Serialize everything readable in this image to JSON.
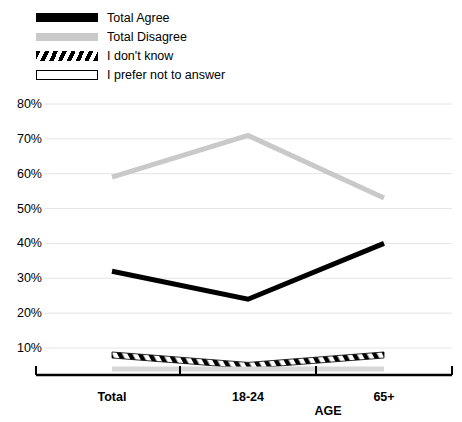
{
  "legend": {
    "items": [
      {
        "label": "Total Agree",
        "style": "solid-black",
        "color": "#000000"
      },
      {
        "label": "Total Disagree",
        "style": "solid-gray",
        "color": "#c9c9c9"
      },
      {
        "label": "I don't know",
        "style": "hatch",
        "color": "#000000"
      },
      {
        "label": "I prefer not to answer",
        "style": "outline",
        "color": "#ffffff"
      }
    ]
  },
  "axes": {
    "y_ticks": [
      "80%",
      "70%",
      "60%",
      "50%",
      "40%",
      "30%",
      "20%",
      "10%"
    ],
    "x_labels": [
      "Total",
      "18-24",
      "65+"
    ],
    "x_title": "AGE"
  },
  "chart_data": {
    "type": "line",
    "title": "",
    "subtitle": "",
    "xlabel": "AGE",
    "ylabel": "",
    "categories": [
      "Total",
      "18-24",
      "65+"
    ],
    "ylim": [
      0,
      80
    ],
    "ytick_values": [
      10,
      20,
      30,
      40,
      50,
      60,
      70,
      80
    ],
    "grid": true,
    "legend_position": "top-left",
    "series": [
      {
        "name": "Total Agree",
        "values": [
          32,
          24,
          40
        ],
        "color": "#000000",
        "style": "solid",
        "width": 5
      },
      {
        "name": "Total Disagree",
        "values": [
          59,
          71,
          53
        ],
        "color": "#c9c9c9",
        "style": "solid",
        "width": 5
      },
      {
        "name": "I don't know",
        "values": [
          8,
          5,
          8
        ],
        "color": "#000000",
        "style": "hatched",
        "width": 6
      },
      {
        "name": "I prefer not to answer",
        "values": [
          4,
          4,
          4
        ],
        "color": "#d7d7d7",
        "style": "outline",
        "width": 5
      }
    ]
  }
}
